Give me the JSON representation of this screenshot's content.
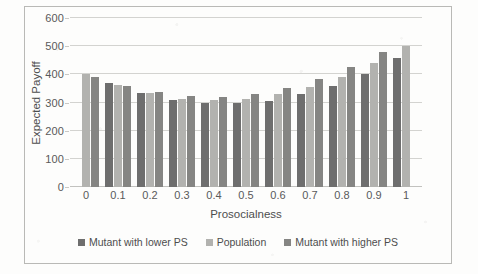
{
  "chart_data": {
    "type": "bar",
    "title": "",
    "xlabel": "Prosocialness",
    "ylabel": "Expected Payoff",
    "categories": [
      "0",
      "0.1",
      "0.2",
      "0.3",
      "0.4",
      "0.5",
      "0.6",
      "0.7",
      "0.8",
      "0.9",
      "1"
    ],
    "ylim": [
      0,
      600
    ],
    "yticks": [
      0,
      100,
      200,
      300,
      400,
      500,
      600
    ],
    "grid": true,
    "legend_position": "bottom",
    "series": [
      {
        "name": "Mutant with lower PS",
        "color": "#6e6e6e",
        "values": [
          null,
          369,
          333,
          309,
          299,
          297,
          307,
          329,
          359,
          402,
          458
        ]
      },
      {
        "name": "Population",
        "color": "#b2b2af",
        "values": [
          402,
          363,
          333,
          314,
          308,
          313,
          330,
          356,
          392,
          441,
          502
        ]
      },
      {
        "name": "Mutant with higher PS",
        "color": "#858583",
        "values": [
          392,
          358,
          336,
          323,
          321,
          331,
          353,
          383,
          425,
          480,
          null
        ]
      }
    ]
  },
  "legend": {
    "items": [
      {
        "label": "Mutant with lower PS",
        "color": "#6e6e6e"
      },
      {
        "label": "Population",
        "color": "#b2b2af"
      },
      {
        "label": "Mutant with higher PS",
        "color": "#858583"
      }
    ]
  }
}
